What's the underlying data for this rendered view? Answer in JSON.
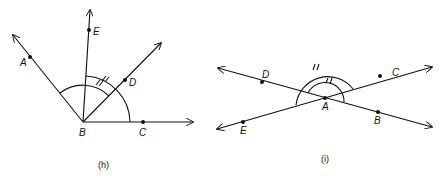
{
  "figures": [
    {
      "caption": "(h)",
      "vertex": "B",
      "points": [
        "A",
        "B",
        "C",
        "D",
        "E"
      ]
    },
    {
      "caption": "(i)",
      "vertex": "A",
      "points": [
        "A",
        "B",
        "C",
        "D",
        "E"
      ]
    }
  ],
  "labels": {
    "h": {
      "A": "A",
      "B": "B",
      "C": "C",
      "D": "D",
      "E": "E",
      "caption": "(h)"
    },
    "i": {
      "A": "A",
      "B": "B",
      "C": "C",
      "D": "D",
      "E": "E",
      "caption": "(i)"
    }
  }
}
